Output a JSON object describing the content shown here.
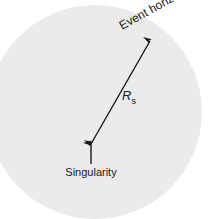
{
  "figure": {
    "background_color": "#ffffff",
    "width": 208,
    "height": 219
  },
  "black_hole": {
    "name": "event-horizon-disc",
    "fill_color": "#ebebeb",
    "center_x": 95,
    "center_y": 112,
    "radius": 107
  },
  "labels": {
    "event_horizon": {
      "text": "Event horizon",
      "color": "#1a1a1a",
      "font_size": 12,
      "rotation_deg": -29,
      "x": 122,
      "y": 30
    },
    "radius_symbol": {
      "text": "R",
      "subscript": "s",
      "color": "#1a1a1a",
      "font_size": 13,
      "x": 122,
      "y": 100
    },
    "singularity": {
      "text": "Singularity",
      "color": "#1a1a1a",
      "font_size": 11,
      "x": 91,
      "y": 176
    }
  },
  "arrows": {
    "radius_arrow": {
      "name": "schwarzschild-radius-arrow",
      "color": "#1a1a1a",
      "stroke_width": 1.4,
      "double_headed": true,
      "x1": 91,
      "y1": 144,
      "x2": 150,
      "y2": 41
    },
    "singularity_arrow": {
      "name": "singularity-pointer-arrow",
      "color": "#1a1a1a",
      "stroke_width": 1.4,
      "double_headed": false,
      "x1": 91,
      "y1": 164,
      "x2": 91,
      "y2": 143
    }
  }
}
